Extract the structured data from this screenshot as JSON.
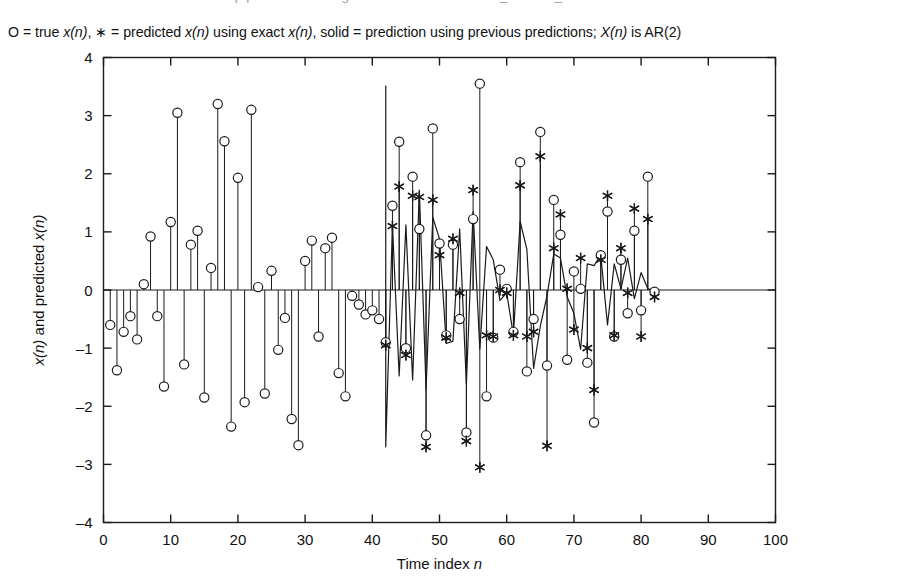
{
  "clipped_header_text": "One-step predictions using LS filter with estimated r_x and R_xx",
  "caption": {
    "full_text": "O = true x(n), * = predicted x(n) using exact x(n), solid = prediction using previous predictions; X(n) is AR(2)",
    "seg1": "O = true ",
    "seg1_it": "x(n)",
    "seg2": ", ∗ = predicted ",
    "seg2_it": "x(n)",
    "seg3": " using exact ",
    "seg3_it": "x(n)",
    "seg4": ", solid = prediction using previous predictions; ",
    "seg4_it": "X(n)",
    "seg5": " is AR(2)"
  },
  "figure_number": "Figure 10.35",
  "axes": {
    "ylabel_main": "x(n) and predicted x(n)",
    "ylabel_seg1_it": "x(n)",
    "ylabel_seg2": " and predicted ",
    "ylabel_seg3_it": "x(n)",
    "xlabel_main": "Time index n",
    "xlabel_seg1": "Time index ",
    "xlabel_seg2_it": "n"
  },
  "chart_data": {
    "type": "line",
    "title": "",
    "subtitle": "O = true x(n), * = predicted x(n) using exact x(n), solid = prediction using previous predictions; X(n) is AR(2)",
    "xlabel": "Time index n",
    "ylabel": "x(n) and predicted x(n)",
    "xlim": [
      0,
      100
    ],
    "ylim": [
      -4,
      4
    ],
    "xticks": [
      0,
      10,
      20,
      30,
      40,
      50,
      60,
      70,
      80,
      90,
      100
    ],
    "yticks": [
      -4,
      -3,
      -2,
      -1,
      0,
      1,
      2,
      3,
      4
    ],
    "grid": false,
    "legend_position": "above-plot-as-text",
    "legend": [
      {
        "marker": "circle",
        "label": "true x(n)"
      },
      {
        "marker": "asterisk",
        "label": "predicted x(n) using exact x(n)"
      },
      {
        "marker": "solid-line",
        "label": "prediction using previous predictions"
      }
    ],
    "series": [
      {
        "name": "true x(n)",
        "marker": "circle",
        "stem": true,
        "x": [
          1,
          2,
          3,
          4,
          5,
          6,
          7,
          8,
          9,
          10,
          11,
          12,
          13,
          14,
          15,
          16,
          17,
          18,
          19,
          20,
          21,
          22,
          23,
          24,
          25,
          26,
          27,
          28,
          29,
          30,
          31,
          32,
          33,
          34,
          35,
          36,
          37,
          38,
          39,
          40,
          41,
          42,
          43,
          44,
          45,
          46,
          47,
          48,
          49,
          50,
          51,
          52,
          53,
          54,
          55,
          56,
          57,
          58,
          59,
          60,
          61,
          62,
          63,
          64,
          65,
          66,
          67,
          68,
          69,
          70,
          71,
          72,
          73,
          74,
          75,
          76,
          77,
          78,
          79,
          80,
          81,
          82
        ],
        "y": [
          -0.6,
          -1.38,
          -0.72,
          -0.45,
          -0.85,
          0.1,
          0.92,
          -0.45,
          -1.66,
          1.17,
          3.05,
          -1.28,
          0.78,
          1.02,
          -1.85,
          0.38,
          3.2,
          2.56,
          -2.35,
          1.93,
          -1.93,
          3.1,
          0.05,
          -1.78,
          0.33,
          -1.03,
          -0.48,
          -2.22,
          -2.67,
          0.5,
          0.85,
          -0.8,
          0.72,
          0.9,
          -1.43,
          -1.83,
          -0.1,
          -0.25,
          -0.42,
          -0.35,
          -0.5,
          -0.9,
          1.45,
          2.55,
          -1.0,
          1.95,
          1.05,
          -2.5,
          2.78,
          0.8,
          -0.78,
          0.78,
          -0.5,
          -2.45,
          1.22,
          3.55,
          -1.83,
          -0.82,
          0.35,
          0.02,
          -0.72,
          2.2,
          -1.4,
          -0.5,
          2.72,
          -1.3,
          1.55,
          0.95,
          -1.2,
          0.32,
          0.02,
          -1.25,
          -2.28,
          0.6,
          1.35,
          -0.8,
          0.52,
          -0.4,
          1.02,
          -0.35,
          1.95,
          -0.03
        ]
      },
      {
        "name": "predicted x(n) using exact x(n)",
        "marker": "asterisk",
        "x": [
          42,
          43,
          44,
          45,
          46,
          47,
          48,
          49,
          50,
          51,
          52,
          53,
          54,
          55,
          56,
          57,
          58,
          59,
          60,
          61,
          62,
          63,
          64,
          65,
          66,
          67,
          68,
          69,
          70,
          71,
          72,
          73,
          74,
          75,
          76,
          77,
          78,
          79,
          80,
          81,
          82
        ],
        "y": [
          -0.95,
          1.1,
          1.78,
          -1.12,
          1.62,
          1.6,
          -2.7,
          1.55,
          0.6,
          -0.82,
          0.88,
          -0.05,
          -2.6,
          1.72,
          -3.05,
          -0.78,
          -0.8,
          0.0,
          -0.05,
          -0.78,
          1.8,
          -0.8,
          -0.72,
          2.3,
          -2.68,
          0.72,
          1.3,
          0.02,
          -0.68,
          0.55,
          -1.0,
          -1.72,
          0.52,
          1.62,
          -0.78,
          0.72,
          -0.05,
          1.4,
          -0.8,
          1.22,
          -0.12
        ]
      },
      {
        "name": "prediction using previous predictions",
        "marker": "none",
        "line": "solid",
        "x": [
          42,
          42,
          43,
          44,
          45,
          46,
          47,
          48,
          49,
          50,
          51,
          52,
          53,
          54,
          55,
          56,
          57,
          58,
          59,
          60,
          61,
          62,
          63,
          64,
          65,
          66,
          67,
          68,
          69,
          70,
          71,
          72,
          73,
          74,
          75,
          76,
          77,
          78,
          79,
          80,
          81,
          82
        ],
        "y": [
          3.52,
          -2.7,
          1.12,
          -1.48,
          1.12,
          -1.55,
          1.72,
          -1.7,
          1.25,
          0.88,
          -0.92,
          -0.88,
          1.05,
          -1.62,
          1.35,
          -1.02,
          0.75,
          0.52,
          -0.18,
          -0.05,
          -0.78,
          1.18,
          0.7,
          -1.35,
          -0.62,
          -0.1,
          0.62,
          0.55,
          -0.12,
          -0.4,
          -1.02,
          0.45,
          0.42,
          0.6,
          -0.6,
          0.45,
          0.02,
          0.55,
          -0.15,
          0.3,
          0.02,
          0.0
        ]
      }
    ]
  }
}
